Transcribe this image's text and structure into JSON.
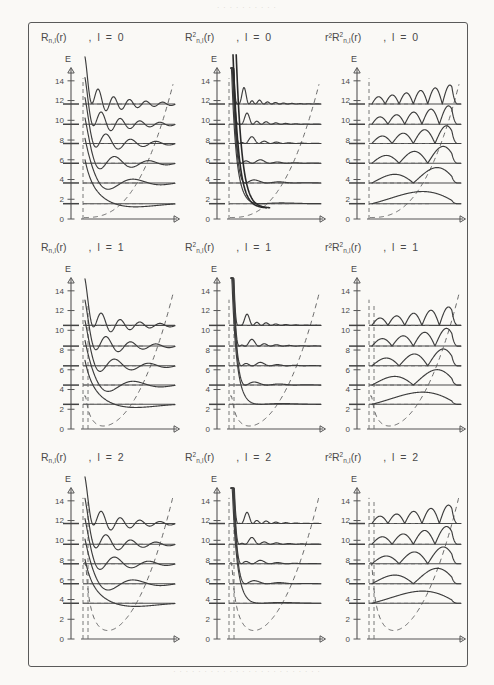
{
  "page": {
    "bleed_top_text": "· · · · · · · · · ·",
    "bleed_bottom_text": "· · · · · · · · · · · · · · · · · · · · · · · ·"
  },
  "axes": {
    "y_label": "E",
    "x_label": "r",
    "y_ticks": [
      "0",
      "2",
      "4",
      "6",
      "8",
      "10",
      "12",
      "14"
    ],
    "y_tick_values": [
      0,
      2,
      4,
      6,
      8,
      10,
      12,
      14
    ],
    "y_min": 0,
    "y_max": 15.4
  },
  "rows": [
    {
      "l_value": "0",
      "headers": [
        {
          "base": "R",
          "sub": "n,l",
          "sup": "",
          "pre": "",
          "arg": "(r)",
          "lcond": ", l = 0"
        },
        {
          "base": "R",
          "sub": "n,l",
          "sup": "2",
          "pre": "",
          "arg": "(r)",
          "lcond": ", l = 0"
        },
        {
          "base": "R",
          "sub": "n,l",
          "sup": "2",
          "pre": "r²",
          "arg": "(r)",
          "lcond": ", l = 0"
        }
      ],
      "levels": [
        1.55,
        3.65,
        5.65,
        7.65,
        9.6,
        11.65
      ],
      "nodes": [
        0,
        1,
        2,
        3,
        4,
        5
      ]
    },
    {
      "l_value": "1",
      "headers": [
        {
          "base": "R",
          "sub": "n,l",
          "sup": "",
          "pre": "",
          "arg": "(r)",
          "lcond": ", l = 1"
        },
        {
          "base": "R",
          "sub": "n,l",
          "sup": "2",
          "pre": "",
          "arg": "(r)",
          "lcond": ", l = 1"
        },
        {
          "base": "R",
          "sub": "n,l",
          "sup": "2",
          "pre": "r²",
          "arg": "(r)",
          "lcond": ", l = 1"
        }
      ],
      "levels": [
        2.5,
        4.45,
        6.4,
        8.4,
        10.5
      ],
      "nodes": [
        0,
        1,
        2,
        3,
        4
      ]
    },
    {
      "l_value": "2",
      "headers": [
        {
          "base": "R",
          "sub": "n,l",
          "sup": "",
          "pre": "",
          "arg": "(r)",
          "lcond": ", l = 2"
        },
        {
          "base": "R",
          "sub": "n,l",
          "sup": "2",
          "pre": "",
          "arg": "(r)",
          "lcond": ", l = 2"
        },
        {
          "base": "R",
          "sub": "n,l",
          "sup": "2",
          "pre": "r²",
          "arg": "(r)",
          "lcond": ", l = 2"
        }
      ],
      "levels": [
        3.62,
        5.6,
        7.62,
        9.6,
        11.7
      ],
      "nodes": [
        0,
        1,
        2,
        3,
        4
      ]
    }
  ],
  "chart_data": {
    "type": "line",
    "xlabel": "r",
    "ylabel": "E",
    "ylim": [
      0,
      15.4
    ],
    "grid": false,
    "legend": "none",
    "columns": [
      "R_nl(r)",
      "R_nl^2(r)",
      "r^2 R_nl^2(r)"
    ],
    "panels": [
      {
        "l": 0,
        "column": "R_nl(r)",
        "energy_levels": [
          1.55,
          3.65,
          5.65,
          7.65,
          9.6,
          11.65
        ],
        "radial_nodes": [
          0,
          1,
          2,
          3,
          4,
          5
        ]
      },
      {
        "l": 0,
        "column": "R_nl^2(r)",
        "energy_levels": [
          1.55,
          3.65,
          5.65,
          7.65,
          9.6,
          11.65
        ],
        "radial_nodes": [
          0,
          1,
          2,
          3,
          4,
          5
        ]
      },
      {
        "l": 0,
        "column": "r^2 R_nl^2(r)",
        "energy_levels": [
          1.55,
          3.65,
          5.65,
          7.65,
          9.6,
          11.65
        ],
        "radial_nodes": [
          0,
          1,
          2,
          3,
          4,
          5
        ]
      },
      {
        "l": 1,
        "column": "R_nl(r)",
        "energy_levels": [
          2.5,
          4.45,
          6.4,
          8.4,
          10.5
        ],
        "radial_nodes": [
          0,
          1,
          2,
          3,
          4
        ]
      },
      {
        "l": 1,
        "column": "R_nl^2(r)",
        "energy_levels": [
          2.5,
          4.45,
          6.4,
          8.4,
          10.5
        ],
        "radial_nodes": [
          0,
          1,
          2,
          3,
          4
        ]
      },
      {
        "l": 1,
        "column": "r^2 R_nl^2(r)",
        "energy_levels": [
          2.5,
          4.45,
          6.4,
          8.4,
          10.5
        ],
        "radial_nodes": [
          0,
          1,
          2,
          3,
          4
        ]
      },
      {
        "l": 2,
        "column": "R_nl(r)",
        "energy_levels": [
          3.62,
          5.6,
          7.62,
          9.6,
          11.7
        ],
        "radial_nodes": [
          0,
          1,
          2,
          3,
          4
        ]
      },
      {
        "l": 2,
        "column": "R_nl^2(r)",
        "energy_levels": [
          3.62,
          5.6,
          7.62,
          9.6,
          11.7
        ],
        "radial_nodes": [
          0,
          1,
          2,
          3,
          4
        ]
      },
      {
        "l": 2,
        "column": "r^2 R_nl^2(r)",
        "energy_levels": [
          3.62,
          5.6,
          7.62,
          9.6,
          11.7
        ],
        "radial_nodes": [
          0,
          1,
          2,
          3,
          4
        ]
      }
    ]
  }
}
